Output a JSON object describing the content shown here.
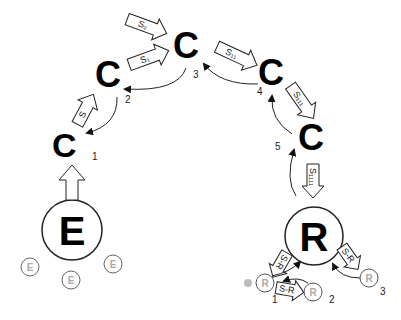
{
  "diagram": {
    "colors": {
      "ink": "#000000",
      "line": "#333333",
      "faint": "#aaaaaa",
      "dot": "#bbbbbb"
    },
    "nodes": {
      "c1": {
        "label": "C",
        "num": "1"
      },
      "c2": {
        "label": "C",
        "num": "2"
      },
      "c3": {
        "label": "C",
        "num": "3"
      },
      "c4": {
        "label": "C",
        "num": "4"
      },
      "c5": {
        "label": "C",
        "num": "5"
      },
      "e": {
        "label": "E"
      },
      "r": {
        "label": "R"
      }
    },
    "small_e": [
      {
        "label": "E"
      },
      {
        "label": "E"
      },
      {
        "label": "E"
      }
    ],
    "small_r": [
      {
        "label": "R",
        "num": "1"
      },
      {
        "label": "R",
        "num": "2"
      },
      {
        "label": "R",
        "num": "3"
      }
    ],
    "arrow_labels": {
      "s": "S",
      "s1": "S₁",
      "s2": "S₂",
      "s11": "S₁₁",
      "s111": "S₁₁₁",
      "s1111": "S₁₁₁₁",
      "sr1": "S-R",
      "sr2": "S-R",
      "sr3": "S-R"
    }
  }
}
